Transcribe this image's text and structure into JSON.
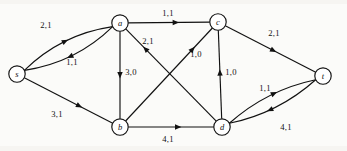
{
  "figure": {
    "background_color": "#fbfbf9",
    "ink_color": "#111111"
  },
  "graph": {
    "node_radius": 8.2,
    "nodes": [
      {
        "id": "s",
        "label": "s",
        "x": 17,
        "y": 74
      },
      {
        "id": "a",
        "label": "a",
        "x": 120,
        "y": 23
      },
      {
        "id": "c",
        "label": "c",
        "x": 218,
        "y": 22
      },
      {
        "id": "t",
        "label": "t",
        "x": 323,
        "y": 76
      },
      {
        "id": "b",
        "label": "b",
        "x": 120,
        "y": 127
      },
      {
        "id": "d",
        "label": "d",
        "x": 222,
        "y": 127
      }
    ],
    "edges": [
      {
        "id": "s-a",
        "from": "s",
        "to": "a",
        "label": "2,1",
        "curve": -16,
        "label_x": 46,
        "label_y": 25,
        "arrow_t": 0.5
      },
      {
        "id": "a-s",
        "from": "a",
        "to": "s",
        "label": "1,1",
        "curve": -16,
        "label_x": 72,
        "label_y": 62,
        "arrow_t": 0.52
      },
      {
        "id": "s-b",
        "from": "s",
        "to": "b",
        "label": "3,1",
        "curve": 0,
        "label_x": 57,
        "label_y": 114,
        "arrow_t": 0.62
      },
      {
        "id": "a-c",
        "from": "a",
        "to": "c",
        "label": "1,1",
        "curve": 0,
        "label_x": 168,
        "label_y": 13,
        "arrow_t": 0.58
      },
      {
        "id": "a-b",
        "from": "a",
        "to": "b",
        "label": "3,0",
        "curve": 0,
        "label_x": 131,
        "label_y": 72,
        "arrow_t": 0.5
      },
      {
        "id": "d-a",
        "from": "d",
        "to": "a",
        "label": "2,1",
        "curve": 0,
        "label_x": 148,
        "label_y": 41,
        "arrow_t": 0.78
      },
      {
        "id": "b-c",
        "from": "b",
        "to": "c",
        "label": "1,0",
        "curve": 0,
        "label_x": 196,
        "label_y": 54,
        "arrow_t": 0.77
      },
      {
        "id": "d-c",
        "from": "d",
        "to": "c",
        "label": "1,0",
        "curve": 0,
        "label_x": 231,
        "label_y": 72,
        "arrow_t": 0.52
      },
      {
        "id": "c-t",
        "from": "c",
        "to": "t",
        "label": "2,1",
        "curve": 0,
        "label_x": 274,
        "label_y": 33,
        "arrow_t": 0.53
      },
      {
        "id": "b-d",
        "from": "b",
        "to": "d",
        "label": "4,1",
        "curve": 0,
        "label_x": 168,
        "label_y": 139,
        "arrow_t": 0.58
      },
      {
        "id": "t-d",
        "from": "t",
        "to": "d",
        "label": "1,1",
        "curve": -13,
        "label_x": 265,
        "label_y": 88,
        "arrow_t": 0.56
      },
      {
        "id": "d-t",
        "from": "d",
        "to": "t",
        "label": "4,1",
        "curve": -13,
        "label_x": 286,
        "label_y": 127,
        "arrow_t": 0.55
      }
    ]
  }
}
